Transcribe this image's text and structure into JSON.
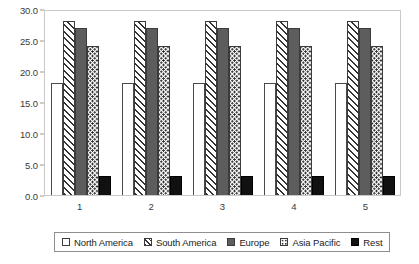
{
  "chart_data": {
    "type": "bar",
    "title": "",
    "subtitle": "",
    "xlabel": "",
    "ylabel": "",
    "categories": [
      "1",
      "2",
      "3",
      "4",
      "5"
    ],
    "series": [
      {
        "name": "North America",
        "values": [
          18,
          18,
          18,
          18,
          18
        ],
        "pattern": "empty-white",
        "color": "#ffffff"
      },
      {
        "name": "South America",
        "values": [
          28,
          28,
          28,
          28,
          28
        ],
        "pattern": "diagonal-hatch",
        "color": "#333333"
      },
      {
        "name": "Europe",
        "values": [
          27,
          27,
          27,
          27,
          27
        ],
        "pattern": "solid-gray",
        "color": "#5d5d5d"
      },
      {
        "name": "Asia Pacific",
        "values": [
          24,
          24,
          24,
          24,
          24
        ],
        "pattern": "dotted",
        "color": "#2f2f2f"
      },
      {
        "name": "Rest",
        "values": [
          3,
          3,
          3,
          3,
          3
        ],
        "pattern": "solid-black",
        "color": "#111111"
      }
    ],
    "ylim": [
      0.0,
      30.0
    ],
    "ytick_step": 5.0,
    "yticks": [
      "0.0",
      "5.0",
      "10.0",
      "15.0",
      "20.0",
      "25.0",
      "30.0"
    ],
    "ytick_values": [
      0.0,
      5.0,
      10.0,
      15.0,
      20.0,
      25.0,
      30.0
    ],
    "grid": false,
    "legend_position": "bottom",
    "legend_entries": [
      "North America",
      "South America",
      "Europe",
      "Asia Pacific",
      "Rest"
    ]
  }
}
